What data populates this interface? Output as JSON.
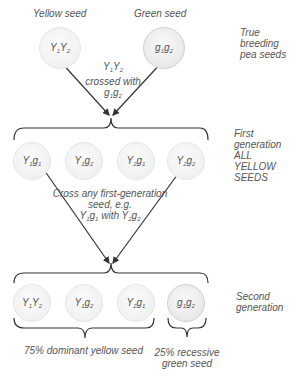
{
  "parents": {
    "yellow_label": "Yellow seed",
    "green_label": "Green seed",
    "yellow_genotype": {
      "a": "Y",
      "a_sub": "1",
      "b": "Y",
      "b_sub": "2"
    },
    "green_genotype": {
      "a": "g",
      "a_sub": "1",
      "b": "g",
      "b_sub": "2"
    },
    "side_label": [
      "True",
      "breeding",
      "pea seeds"
    ]
  },
  "cross1": {
    "line1": {
      "a": "Y",
      "a_sub": "1",
      "b": "Y",
      "b_sub": "2"
    },
    "line2": "crossed with",
    "line3": {
      "a": "g",
      "a_sub": "1",
      "b": "g",
      "b_sub": "2"
    }
  },
  "first_generation": {
    "seeds": [
      {
        "a": "Y",
        "a_sub": "1",
        "b": "g",
        "b_sub": "1"
      },
      {
        "a": "Y",
        "a_sub": "1",
        "b": "g",
        "b_sub": "2"
      },
      {
        "a": "Y",
        "a_sub": "2",
        "b": "g",
        "b_sub": "1"
      },
      {
        "a": "Y",
        "a_sub": "2",
        "b": "g",
        "b_sub": "2"
      }
    ],
    "side_label": [
      "First",
      "generation",
      "ALL",
      "YELLOW",
      "SEEDS"
    ]
  },
  "cross2": {
    "line1": "Cross any first-generation",
    "line2": "seed, e.g.",
    "line3": {
      "a": "Y",
      "a_sub": "1",
      "b": "g",
      "b_sub": "1",
      "mid": " with ",
      "c": "Y",
      "c_sub": "2",
      "d": "g",
      "d_sub": "2"
    }
  },
  "second_generation": {
    "seeds": [
      {
        "a": "Y",
        "a_sub": "1",
        "b": "Y",
        "b_sub": "2"
      },
      {
        "a": "Y",
        "a_sub": "1",
        "b": "g",
        "b_sub": "2"
      },
      {
        "a": "Y",
        "a_sub": "2",
        "b": "g",
        "b_sub": "1"
      },
      {
        "a": "g",
        "a_sub": "1",
        "b": "g",
        "b_sub": "2"
      }
    ],
    "side_label": [
      "Second",
      "generation"
    ],
    "dominant_label": "75% dominant yellow seed",
    "recessive_label": [
      "25% recessive",
      "green seed"
    ]
  },
  "colors": {
    "line": "#333333",
    "text": "#555555",
    "seed_fill": "#f1f1f1"
  }
}
